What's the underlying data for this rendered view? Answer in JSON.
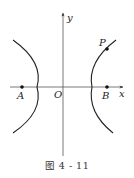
{
  "figure": {
    "caption": "图 4 - 11",
    "axes": {
      "x_label": "x",
      "y_label": "y",
      "origin_label": "O"
    },
    "points": [
      {
        "name": "A",
        "label": "A",
        "px": 22,
        "py": 87
      },
      {
        "name": "B",
        "label": "B",
        "px": 107,
        "py": 87
      },
      {
        "name": "P",
        "label": "P",
        "px": 107,
        "py": 49
      }
    ],
    "curve": "hyperbola",
    "colors": {
      "stroke": "#222222",
      "axis": "#555555",
      "background": "#ffffff"
    }
  }
}
